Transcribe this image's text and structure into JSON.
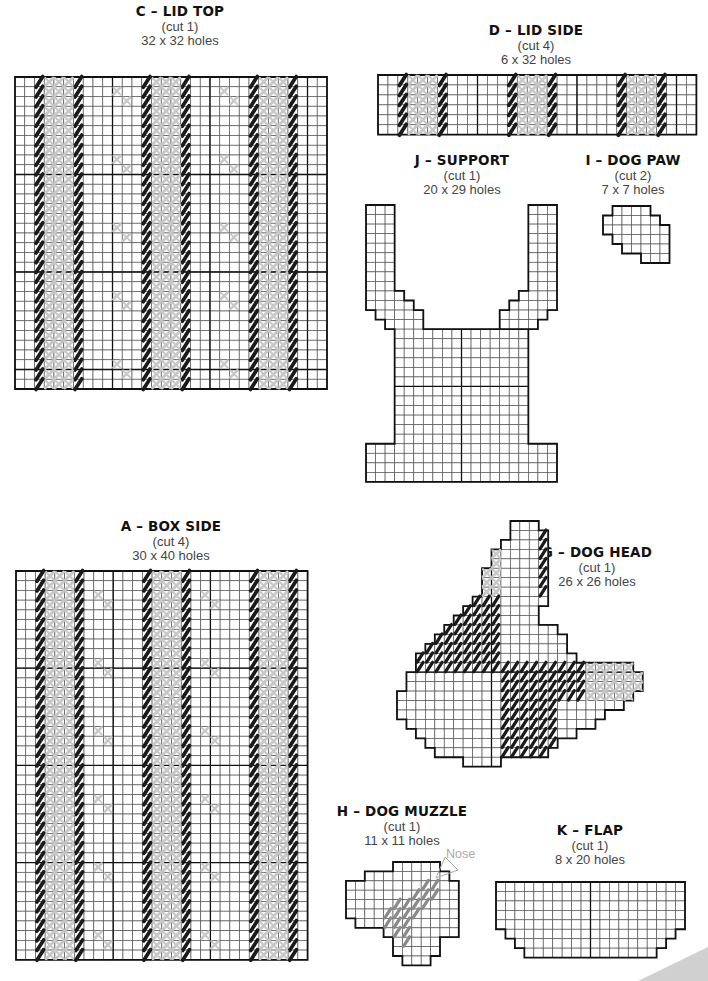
{
  "pieces": {
    "C": {
      "title": "C – LID TOP",
      "cut": "(cut 1)",
      "size": "32 x 32 holes"
    },
    "D": {
      "title": "D – LID SIDE",
      "cut": "(cut 4)",
      "size": "6 x 32 holes"
    },
    "J": {
      "title": "J – SUPPORT",
      "cut": "(cut 1)",
      "size": "20 x 29 holes"
    },
    "I": {
      "title": "I – DOG PAW",
      "cut": "(cut 2)",
      "size": "7 x 7 holes"
    },
    "A": {
      "title": "A – BOX SIDE",
      "cut": "(cut 4)",
      "size": "30 x 40 holes"
    },
    "G": {
      "title": "G – DOG HEAD",
      "cut": "(cut 1)",
      "size": "26 x 26 holes"
    },
    "H": {
      "title": "H – DOG MUZZLE",
      "cut": "(cut 1)",
      "size": "11 x 11 holes",
      "annotation": "Nose"
    },
    "K": {
      "title": "K – FLAP",
      "cut": "(cut 1)",
      "size": "8 x 20 holes"
    }
  },
  "colors": {
    "grid_line": "#555555",
    "outline": "#111111",
    "dark_stitch": "#1a1a1a",
    "light_stitch": "#c8c8c8",
    "mid_stitch": "#8a8a8a",
    "annotation": "#aaaaaa"
  },
  "grids": {
    "C": {
      "x": 15,
      "y": 77,
      "cols": 32,
      "rows": 32,
      "cell": 9.75,
      "major_every": 10,
      "pattern": "stripes"
    },
    "D": {
      "x": 378,
      "y": 75,
      "cols": 32,
      "rows": 6,
      "cell": 9.95,
      "major_every": 10,
      "pattern": "stripes"
    },
    "A": {
      "x": 16,
      "y": 571,
      "cols": 30,
      "rows": 40,
      "cell": 9.72,
      "major_every": 10,
      "pattern": "stripes"
    }
  }
}
